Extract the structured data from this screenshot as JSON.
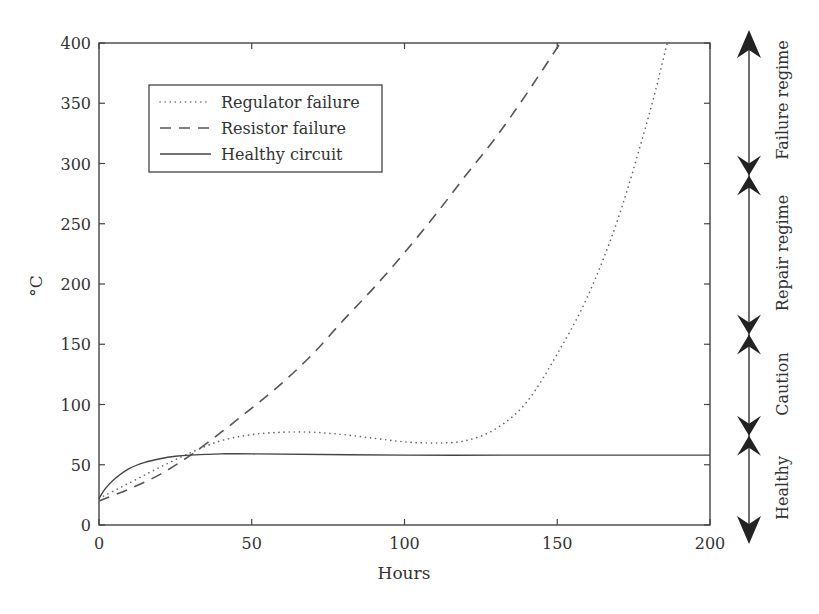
{
  "chart_data": {
    "type": "line",
    "title": "",
    "xlabel": "Hours",
    "ylabel": "°C",
    "xlim": [
      0,
      200
    ],
    "ylim": [
      0,
      400
    ],
    "xticks": [
      "0",
      "50",
      "100",
      "150",
      "200"
    ],
    "yticks": [
      "0",
      "50",
      "100",
      "150",
      "200",
      "250",
      "300",
      "350",
      "400"
    ],
    "grid": false,
    "legend_position": "upper-left",
    "series": [
      {
        "name": "Regulator failure",
        "style": "dotted",
        "x": [
          0,
          10,
          20,
          30,
          40,
          50,
          60,
          70,
          80,
          90,
          100,
          110,
          120,
          130,
          140,
          150,
          160,
          170,
          180,
          186
        ],
        "y": [
          22,
          35,
          48,
          60,
          70,
          75,
          77,
          77,
          75,
          72,
          69,
          68,
          70,
          80,
          102,
          142,
          190,
          255,
          340,
          400
        ]
      },
      {
        "name": "Resistor failure",
        "style": "dashed",
        "x": [
          0,
          10,
          20,
          30,
          40,
          50,
          60,
          70,
          80,
          90,
          100,
          110,
          120,
          130,
          140,
          151
        ],
        "y": [
          20,
          30,
          42,
          58,
          77,
          97,
          118,
          142,
          170,
          197,
          226,
          257,
          290,
          322,
          358,
          400
        ]
      },
      {
        "name": "Healthy circuit",
        "style": "solid",
        "x": [
          0,
          2,
          5,
          10,
          15,
          20,
          25,
          30,
          40,
          50,
          100,
          150,
          200
        ],
        "y": [
          22,
          30,
          38,
          47,
          52,
          55,
          57,
          58,
          59,
          59,
          58,
          58,
          58
        ]
      }
    ],
    "regimes": [
      {
        "label": "Healthy",
        "from": 0,
        "to": 74
      },
      {
        "label": "Caution",
        "from": 74,
        "to": 158
      },
      {
        "label": "Repair regime",
        "from": 158,
        "to": 290
      },
      {
        "label": "Failure regime",
        "from": 290,
        "to": 410
      }
    ]
  }
}
